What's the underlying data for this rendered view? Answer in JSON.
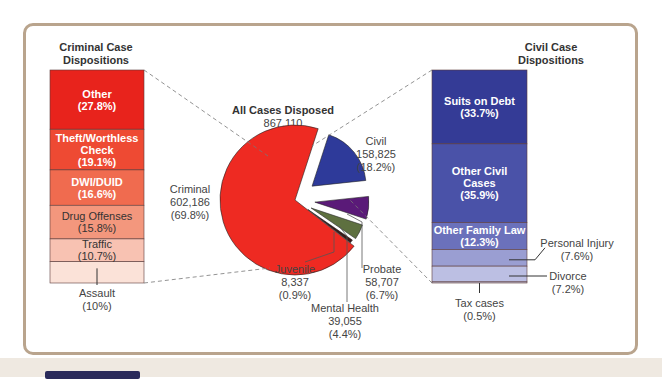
{
  "chart_data": {
    "type": "pie",
    "title": "All Cases Disposed",
    "total": "867,110",
    "total_pct": "(100%)",
    "slices": [
      {
        "name": "Civil",
        "value": 158825,
        "value_label": "158,825",
        "pct": 18.2,
        "pct_label": "(18.2%)",
        "color": "#2e3a9a"
      },
      {
        "name": "Probate",
        "value": 58707,
        "value_label": "58,707",
        "pct": 6.7,
        "pct_label": "(6.7%)",
        "color": "#5a1a78"
      },
      {
        "name": "Mental Health",
        "value": 39055,
        "value_label": "39,055",
        "pct": 4.4,
        "pct_label": "(4.4%)",
        "color": "#5e7040"
      },
      {
        "name": "Juvenile",
        "value": 8337,
        "value_label": "8,337",
        "pct": 0.9,
        "pct_label": "(0.9%)",
        "color": "#3a1a1a"
      },
      {
        "name": "Criminal",
        "value": 602186,
        "value_label": "602,186",
        "pct": 69.8,
        "pct_label": "(69.8%)",
        "color": "#ee2a22"
      }
    ],
    "criminal_breakdown": {
      "title_line1": "Criminal Case",
      "title_line2": "Dispositions",
      "segments": [
        {
          "label_lines": [
            "Other",
            "(27.8%)"
          ],
          "pct": 27.8,
          "color": "#e8231c",
          "text_color": "#ffffff"
        },
        {
          "label_lines": [
            "Theft/Worthless",
            "Check",
            "(19.1%)"
          ],
          "pct": 19.1,
          "color": "#ee4a33",
          "text_color": "#ffffff"
        },
        {
          "label_lines": [
            "DWI/DUID",
            "(16.6%)"
          ],
          "pct": 16.6,
          "color": "#f06b4f",
          "text_color": "#ffffff"
        },
        {
          "label_lines": [
            "Drug Offenses",
            "(15.8%)"
          ],
          "pct": 15.8,
          "color": "#f3977d",
          "text_color": "#333333"
        },
        {
          "label_lines": [
            "Traffic",
            "(10.7%)"
          ],
          "pct": 10.7,
          "color": "#f8c2b2",
          "text_color": "#333333"
        },
        {
          "label_lines": [
            "Assault",
            "(10%)"
          ],
          "pct": 10.0,
          "color": "#fbe2d8",
          "text_color": "#333333",
          "callout": true
        }
      ]
    },
    "civil_breakdown": {
      "title_line1": "Civil Case",
      "title_line2": "Dispositions",
      "segments": [
        {
          "label_lines": [
            "Suits on Debt",
            "(33.7%)"
          ],
          "pct": 33.7,
          "color": "#343b96",
          "text_color": "#ffffff"
        },
        {
          "label_lines": [
            "Other Civil",
            "Cases",
            "(35.9%)"
          ],
          "pct": 35.9,
          "color": "#4a52a8",
          "text_color": "#ffffff"
        },
        {
          "label_lines": [
            "Other Family Law",
            "(12.3%)"
          ],
          "pct": 12.3,
          "color": "#6b71bb",
          "text_color": "#ffffff"
        },
        {
          "label_lines": [
            "Personal Injury",
            "(7.6%)"
          ],
          "pct": 7.6,
          "color": "#9a9ed2",
          "text_color": "#333333",
          "callout": "right"
        },
        {
          "label_lines": [
            "Divorce",
            "(7.2%)"
          ],
          "pct": 7.2,
          "color": "#bcbfe3",
          "text_color": "#333333",
          "callout": "right"
        },
        {
          "label_lines": [
            "Tax cases",
            "(0.5%)"
          ],
          "pct": 0.5,
          "color": "#d8daf0",
          "text_color": "#333333",
          "callout": "below"
        }
      ]
    }
  }
}
